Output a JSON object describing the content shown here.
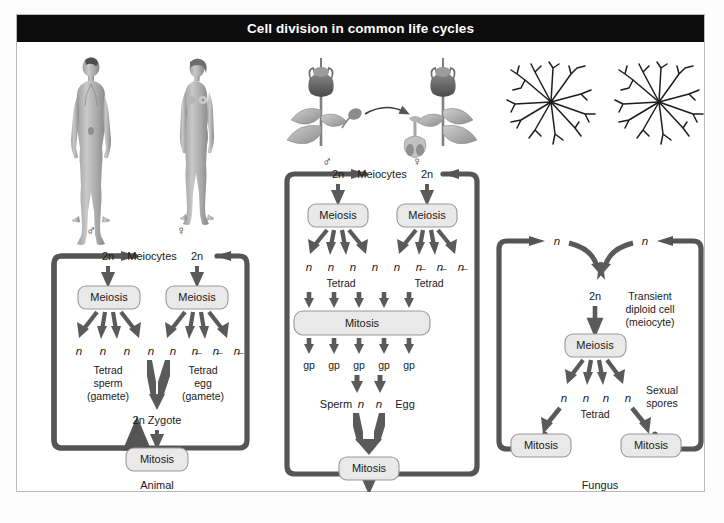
{
  "figure": {
    "title": "Cell division in common life cycles",
    "title_bg": "#0d0d0d",
    "title_fg": "#ffffff",
    "frame_border": "#b9b9b9",
    "background": "#ffffff",
    "loop_color": "#555555",
    "arrow_color": "#5a5a5a",
    "box_fill": "#e9e9e9",
    "box_stroke": "#9a9a9a"
  },
  "panels": [
    {
      "id": "animal",
      "caption": "Animal",
      "organism_icons": [
        "male-human-figure",
        "female-human-figure"
      ],
      "sex_symbols": {
        "male": "♂",
        "female": "♀"
      },
      "top_row": {
        "left_ploidy": "2n",
        "center_label": "Meiocytes",
        "right_ploidy": "2n"
      },
      "left_branch": {
        "division_box": "Meiosis",
        "products": [
          "n",
          "n",
          "n",
          "n"
        ],
        "product_label_line1": "Tetrad",
        "product_label_line2": "sperm",
        "product_label_line3": "(gamete)"
      },
      "right_branch": {
        "division_box": "Meiosis",
        "products": [
          "n",
          "n̶",
          "n̶",
          "n̶"
        ],
        "product_label_line1": "Tetrad",
        "product_label_line2": "egg",
        "product_label_line3": "(gamete)"
      },
      "fusion_label": "2n Zygote",
      "growth_box": "Mitosis"
    },
    {
      "id": "plant",
      "caption": "Plant",
      "organism_icons": [
        "flowering-plant-male",
        "flowering-plant-female",
        "pollen-transfer-arrow",
        "pollen-grain",
        "pistil"
      ],
      "sex_symbols": {
        "male": "♂",
        "female": "♀"
      },
      "top_row": {
        "left_ploidy": "2n",
        "center_label": "Meiocytes",
        "right_ploidy": "2n"
      },
      "left_branch": {
        "division_box": "Meiosis",
        "products": [
          "n",
          "n",
          "n",
          "n"
        ],
        "product_label_line1": "Tetrad"
      },
      "right_branch": {
        "division_box": "Meiosis",
        "products": [
          "n",
          "n̶",
          "n̶",
          "n̶"
        ],
        "product_label_line1": "Tetrad"
      },
      "gametophyte_box": "Mitosis",
      "gametophytes": [
        "gp",
        "gp",
        "gp",
        "gp",
        "gp"
      ],
      "gamete_row": {
        "left_label": "Sperm",
        "left_ploidy": "n",
        "right_ploidy": "n",
        "right_label": "Egg"
      },
      "fusion_label": "2n Zygote",
      "growth_box": "Mitosis"
    },
    {
      "id": "fungus",
      "caption": "Fungus",
      "organism_icons": [
        "mycelium-network-left",
        "mycelium-network-right"
      ],
      "top_row": {
        "left_ploidy": "n",
        "right_ploidy": "n"
      },
      "diploid_label": "2n",
      "diploid_note_line1": "Transient",
      "diploid_note_line2": "diploid cell",
      "diploid_note_line3": "(meiocyte)",
      "division_box": "Meiosis",
      "products": [
        "n",
        "n",
        "n",
        "n"
      ],
      "product_label": "Tetrad",
      "spores_label_line1": "Sexual",
      "spores_label_line2": "spores",
      "growth_box_left": "Mitosis",
      "growth_box_right": "Mitosis"
    }
  ]
}
